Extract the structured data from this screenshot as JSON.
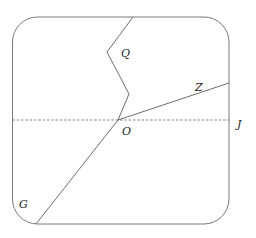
{
  "diagram": {
    "frame": {
      "x": 12.5,
      "y": 17,
      "width": 216.5,
      "height": 207,
      "rx": 25,
      "stroke": "#7a7a7a"
    },
    "origin": {
      "x": 118,
      "y": 120
    },
    "labels": {
      "Q": "Q",
      "Z": "Z",
      "O": "O",
      "J": "J",
      "G": "G"
    },
    "paths": {
      "q_path": [
        [
          133,
          17
        ],
        [
          107,
          52
        ],
        [
          129,
          94
        ],
        [
          118,
          120
        ]
      ],
      "z_ray": [
        [
          118,
          120
        ],
        [
          229,
          83
        ]
      ],
      "g_ray": [
        [
          118,
          120
        ],
        [
          36,
          224
        ]
      ],
      "j_dashed": [
        [
          12.5,
          120
        ],
        [
          229,
          120
        ]
      ]
    },
    "line_color": "#6e6e6e",
    "dash_color": "#777777"
  }
}
